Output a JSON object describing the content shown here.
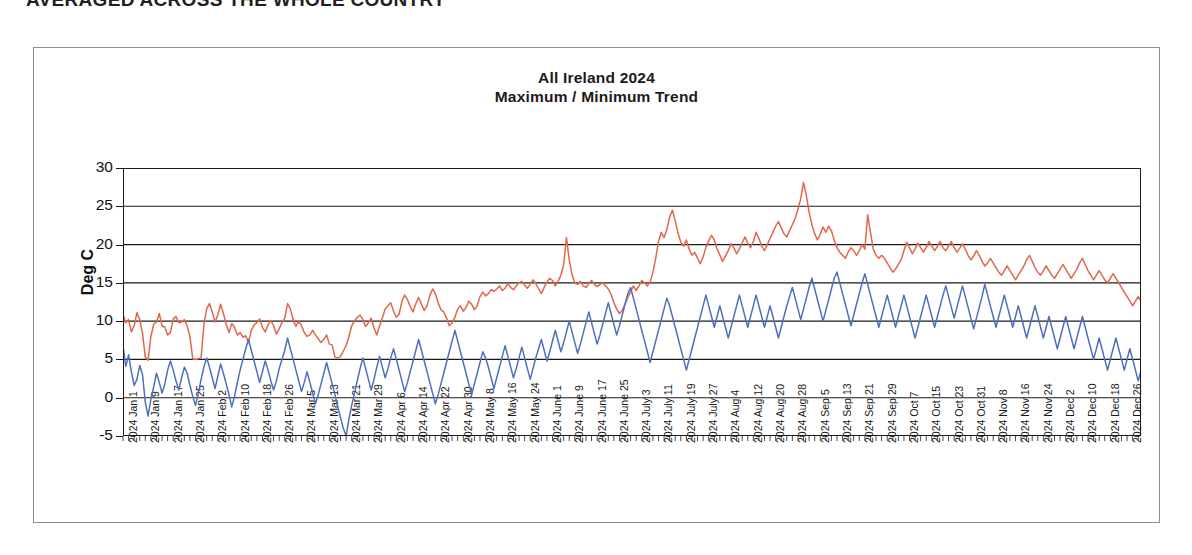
{
  "page_heading": "AVERAGED ACROSS THE WHOLE COUNTRY",
  "chart_data": {
    "type": "line",
    "title": "All Ireland 2024",
    "subtitle": "Maximum / Minimum Trend",
    "xlabel": "",
    "ylabel": "Deg C",
    "ylim": [
      -5,
      30
    ],
    "ytick_step": 5,
    "yticks": [
      -5,
      0,
      5,
      10,
      15,
      20,
      25,
      30
    ],
    "grid": true,
    "grid_axis": "y",
    "legend": "none",
    "x_tick_interval_days": 8,
    "x_start": "2024 Jan 1",
    "x_end": "2024 Dec 26",
    "n_points": 366,
    "x_tick_labels": [
      "2024 Jan 1",
      "2024 Jan 9",
      "2024 Jan 17",
      "2024 Jan 25",
      "2024 Feb 2",
      "2024 Feb 10",
      "2024 Feb 18",
      "2024 Feb 26",
      "2024 Mar 5",
      "2024 Mar 13",
      "2024 Mar 21",
      "2024 Mar 29",
      "2024 Apr 6",
      "2024 Apr 14",
      "2024 Apr 22",
      "2024 Apr 30",
      "2024 May 8",
      "2024 May 16",
      "2024 May 24",
      "2024 June 1",
      "2024 June 9",
      "2024 June 17",
      "2024 June 25",
      "2024 July 3",
      "2024 July 11",
      "2024 July 19",
      "2024 July 27",
      "2024 Aug 4",
      "2024 Aug 12",
      "2024 Aug 20",
      "2024 Aug 28",
      "2024 Sep 5",
      "2024 Sep 13",
      "2024 Sep 21",
      "2024 Sep 29",
      "2024 Oct 7",
      "2024 Oct 15",
      "2024 Oct 23",
      "2024 Oct 31",
      "2024 Nov 8",
      "2024 Nov 16",
      "2024 Nov 24",
      "2024 Dec 2",
      "2024 Dec 10",
      "2024 Dec 18",
      "2024 Dec 26"
    ],
    "colors": {
      "maximum": "#e2674a",
      "minimum": "#4f6fbe",
      "axis": "#1a1a1a",
      "frame": "#8d8d8d"
    },
    "series": [
      {
        "name": "Maximum",
        "color": "#e2674a",
        "values": [
          10.9,
          9.8,
          10.2,
          8.6,
          9.4,
          11.1,
          10.2,
          8.4,
          5.3,
          4.9,
          8.0,
          9.6,
          9.9,
          11.0,
          9.4,
          9.2,
          8.2,
          8.5,
          10.3,
          10.6,
          9.8,
          9.9,
          10.2,
          9.4,
          8.0,
          5.1,
          5.0,
          5.1,
          5.2,
          9.5,
          11.6,
          12.3,
          11.2,
          9.9,
          10.8,
          12.2,
          11.0,
          9.6,
          8.5,
          9.7,
          9.2,
          8.2,
          8.5,
          7.9,
          8.1,
          7.2,
          8.8,
          9.5,
          9.8,
          10.3,
          9.2,
          8.6,
          9.5,
          10.1,
          9.4,
          8.3,
          9.0,
          9.8,
          10.4,
          12.3,
          11.6,
          10.2,
          9.3,
          10.0,
          9.4,
          8.5,
          8.0,
          8.2,
          8.8,
          8.2,
          7.7,
          7.2,
          7.6,
          8.2,
          7.0,
          6.9,
          5.3,
          5.2,
          5.4,
          6.1,
          6.8,
          8.0,
          9.4,
          10.0,
          10.5,
          10.8,
          10.2,
          9.3,
          9.8,
          10.4,
          9.1,
          8.2,
          9.4,
          10.4,
          11.6,
          12.0,
          12.4,
          11.3,
          10.5,
          10.9,
          12.6,
          13.4,
          12.8,
          11.9,
          11.2,
          12.3,
          13.1,
          12.2,
          11.4,
          12.0,
          13.3,
          14.2,
          13.6,
          12.4,
          11.5,
          11.2,
          10.4,
          9.4,
          9.8,
          10.5,
          11.6,
          12.0,
          11.3,
          11.8,
          12.6,
          12.2,
          11.5,
          12.0,
          13.2,
          13.8,
          13.3,
          13.6,
          14.1,
          13.9,
          14.2,
          14.6,
          14.0,
          14.3,
          14.9,
          14.4,
          14.1,
          14.6,
          15.0,
          15.2,
          14.7,
          14.3,
          14.8,
          15.4,
          14.9,
          14.2,
          13.6,
          14.4,
          15.1,
          15.6,
          15.3,
          14.6,
          15.2,
          16.0,
          17.4,
          20.9,
          18.0,
          16.1,
          15.0,
          14.8,
          15.2,
          14.6,
          14.4,
          14.9,
          15.3,
          14.8,
          14.5,
          14.8,
          15.0,
          14.6,
          14.2,
          13.5,
          12.4,
          11.6,
          11.0,
          11.4,
          12.2,
          13.1,
          13.8,
          14.6,
          14.0,
          14.6,
          15.3,
          15.0,
          14.6,
          15.1,
          16.4,
          18.2,
          20.4,
          21.6,
          20.9,
          22.0,
          23.6,
          24.5,
          23.1,
          21.5,
          20.3,
          19.8,
          20.6,
          19.4,
          18.6,
          19.0,
          18.2,
          17.5,
          18.4,
          19.6,
          20.5,
          21.2,
          20.6,
          19.4,
          18.6,
          17.8,
          18.5,
          19.2,
          20.1,
          19.6,
          18.8,
          19.4,
          20.2,
          21.0,
          20.2,
          19.6,
          20.4,
          21.6,
          20.8,
          19.8,
          19.2,
          20.0,
          20.8,
          21.6,
          22.4,
          23.0,
          22.2,
          21.4,
          21.0,
          21.8,
          22.6,
          23.4,
          24.6,
          26.0,
          28.1,
          26.4,
          24.2,
          22.6,
          21.4,
          20.6,
          21.4,
          22.3,
          21.6,
          22.4,
          21.8,
          20.6,
          19.6,
          19.0,
          18.6,
          18.2,
          19.0,
          19.6,
          19.2,
          18.6,
          19.2,
          20.0,
          19.4,
          23.9,
          21.6,
          19.4,
          18.6,
          18.2,
          18.6,
          18.2,
          17.6,
          17.0,
          16.4,
          16.8,
          17.4,
          18.0,
          19.2,
          20.3,
          19.6,
          18.8,
          19.4,
          20.2,
          19.6,
          19.0,
          19.6,
          20.4,
          19.8,
          19.2,
          19.8,
          20.4,
          19.6,
          19.2,
          19.8,
          20.4,
          19.6,
          19.0,
          19.5,
          20.1,
          19.4,
          18.6,
          18.0,
          18.5,
          19.2,
          18.6,
          17.8,
          17.2,
          17.6,
          18.2,
          17.6,
          17.0,
          16.4,
          16.0,
          16.6,
          17.2,
          16.6,
          16.0,
          15.4,
          16.0,
          16.6,
          17.2,
          18.0,
          18.6,
          17.8,
          17.0,
          16.4,
          16.0,
          16.6,
          17.2,
          16.6,
          16.0,
          15.6,
          16.2,
          16.8,
          17.4,
          16.8,
          16.2,
          15.6,
          16.2,
          16.8,
          17.6,
          18.2,
          17.4,
          16.6,
          16.0,
          15.4,
          16.0,
          16.6,
          16.0,
          15.4,
          15.0,
          15.6,
          16.2,
          15.6,
          15.0,
          14.4,
          13.8,
          13.2,
          12.6,
          12.0,
          12.6,
          13.2,
          12.6,
          12.0,
          11.6,
          12.2,
          12.8,
          12.2,
          11.6,
          11.0,
          11.4,
          12.0,
          11.4,
          10.8,
          10.2,
          10.8,
          11.4,
          10.8,
          10.2,
          9.6,
          10.2,
          10.8,
          10.2,
          9.8,
          10.4,
          11.0,
          10.4,
          9.8,
          9.4,
          10.0,
          10.6,
          11.2,
          10.6,
          10.0,
          10.6,
          11.2,
          11.8,
          11.2,
          10.6,
          10.0,
          9.4,
          9.8,
          10.4,
          11.0,
          11.6,
          11.0,
          10.4,
          9.8,
          9.2,
          8.6,
          8.0,
          7.4,
          8.0,
          8.6,
          7.9,
          7.2,
          7.8
        ]
      },
      {
        "name": "Minimum",
        "color": "#4f6fbe",
        "values": [
          6.8,
          4.1,
          5.6,
          3.4,
          1.6,
          2.4,
          4.2,
          3.0,
          -0.6,
          -2.4,
          -0.2,
          1.4,
          3.2,
          2.0,
          0.6,
          1.8,
          3.6,
          4.8,
          3.6,
          2.2,
          1.0,
          2.6,
          4.0,
          3.2,
          1.6,
          0.2,
          -1.0,
          0.6,
          2.4,
          4.0,
          5.2,
          4.0,
          2.6,
          1.2,
          2.8,
          4.4,
          3.2,
          1.8,
          0.4,
          -1.2,
          0.2,
          2.0,
          3.6,
          5.0,
          6.4,
          7.6,
          6.2,
          4.8,
          3.4,
          2.0,
          3.4,
          4.8,
          3.6,
          2.2,
          1.0,
          2.2,
          3.8,
          5.0,
          6.2,
          7.8,
          6.4,
          5.0,
          3.6,
          2.2,
          0.8,
          2.0,
          3.4,
          2.0,
          0.6,
          -0.8,
          0.4,
          1.8,
          3.2,
          4.6,
          3.2,
          1.8,
          0.4,
          -1.2,
          -2.6,
          -4.0,
          -5.0,
          -2.8,
          -1.0,
          0.6,
          2.2,
          3.8,
          5.2,
          3.8,
          2.4,
          1.0,
          2.4,
          4.0,
          5.4,
          4.0,
          2.6,
          3.8,
          5.2,
          6.4,
          5.0,
          3.6,
          2.2,
          0.8,
          2.0,
          3.4,
          4.8,
          6.2,
          7.6,
          6.2,
          4.8,
          3.4,
          2.0,
          0.6,
          -0.8,
          0.4,
          1.8,
          3.2,
          4.6,
          6.0,
          7.4,
          8.8,
          7.4,
          6.0,
          4.6,
          3.2,
          1.8,
          0.4,
          1.8,
          3.2,
          4.6,
          6.0,
          5.2,
          4.0,
          2.6,
          1.2,
          2.6,
          4.0,
          5.4,
          6.8,
          5.4,
          4.0,
          2.6,
          3.8,
          5.2,
          6.6,
          5.2,
          3.8,
          2.4,
          3.8,
          5.2,
          6.4,
          7.6,
          6.2,
          4.8,
          6.0,
          7.4,
          8.8,
          7.4,
          6.0,
          7.2,
          8.6,
          10.0,
          8.6,
          7.2,
          5.8,
          7.0,
          8.4,
          9.8,
          11.2,
          9.8,
          8.4,
          7.0,
          8.2,
          9.6,
          11.0,
          12.4,
          11.0,
          9.6,
          8.2,
          9.4,
          10.8,
          12.2,
          13.6,
          14.4,
          13.0,
          11.6,
          10.2,
          8.8,
          7.4,
          6.0,
          4.6,
          6.0,
          7.4,
          8.8,
          10.2,
          11.6,
          13.0,
          12.0,
          10.6,
          9.2,
          7.8,
          6.4,
          5.0,
          3.6,
          5.0,
          6.4,
          7.8,
          9.2,
          10.6,
          12.0,
          13.4,
          12.0,
          10.6,
          9.2,
          10.6,
          12.0,
          10.6,
          9.2,
          7.8,
          9.2,
          10.6,
          12.0,
          13.4,
          12.0,
          10.6,
          9.2,
          10.6,
          12.0,
          13.4,
          12.0,
          10.6,
          9.2,
          10.6,
          12.0,
          10.6,
          9.2,
          7.8,
          9.2,
          10.6,
          12.0,
          13.2,
          14.4,
          13.0,
          11.6,
          10.2,
          11.6,
          13.0,
          14.4,
          15.6,
          14.2,
          12.8,
          11.4,
          10.0,
          11.4,
          12.8,
          14.2,
          15.6,
          16.4,
          15.0,
          13.6,
          12.2,
          10.8,
          9.4,
          10.8,
          12.2,
          13.6,
          15.0,
          16.2,
          14.8,
          13.4,
          12.0,
          10.6,
          9.2,
          10.6,
          12.0,
          13.4,
          12.0,
          10.6,
          9.2,
          10.6,
          12.0,
          13.4,
          12.0,
          10.6,
          9.2,
          7.8,
          9.2,
          10.6,
          12.0,
          13.4,
          12.0,
          10.6,
          9.2,
          10.6,
          12.0,
          13.4,
          14.6,
          13.2,
          11.8,
          10.4,
          11.8,
          13.2,
          14.6,
          13.2,
          11.8,
          10.4,
          9.0,
          10.4,
          11.8,
          13.2,
          14.8,
          13.4,
          12.0,
          10.6,
          9.2,
          10.6,
          12.0,
          13.4,
          12.0,
          10.6,
          9.2,
          10.6,
          12.0,
          10.6,
          9.2,
          7.8,
          9.2,
          10.6,
          12.0,
          10.6,
          9.2,
          7.8,
          9.2,
          10.6,
          9.2,
          7.8,
          6.4,
          7.8,
          9.2,
          10.6,
          9.2,
          7.8,
          6.4,
          7.8,
          9.2,
          10.6,
          9.2,
          7.8,
          6.4,
          5.0,
          6.4,
          7.8,
          6.4,
          5.0,
          3.6,
          5.0,
          6.4,
          7.8,
          6.4,
          5.0,
          3.6,
          5.0,
          6.4,
          5.0,
          3.6,
          2.2,
          3.6,
          5.0,
          6.4,
          5.0,
          3.6,
          2.2,
          0.8,
          2.2,
          3.6,
          2.2,
          0.8,
          -0.4,
          1.0,
          2.4,
          3.8,
          2.4,
          1.0,
          2.4,
          3.8,
          5.2,
          3.8,
          2.4,
          3.8,
          5.2,
          6.4,
          5.0,
          3.6,
          2.2,
          3.6,
          5.0,
          6.4,
          7.8,
          6.4,
          5.0,
          3.6,
          5.0,
          6.4,
          7.8,
          6.4,
          5.0,
          3.6,
          2.2,
          3.6,
          5.0,
          6.4,
          7.6,
          6.2,
          4.8,
          3.4,
          2.0,
          3.4,
          4.8,
          6.2,
          4.8,
          0.4
        ]
      }
    ]
  }
}
